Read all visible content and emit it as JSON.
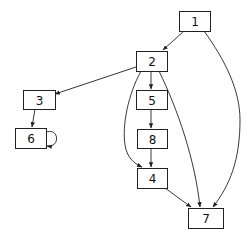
{
  "diagram": {
    "type": "directed-graph",
    "nodes": [
      {
        "id": "1",
        "label": "1",
        "x": 179,
        "y": 11,
        "w": 31,
        "h": 20
      },
      {
        "id": "2",
        "label": "2",
        "x": 136,
        "y": 51,
        "w": 31,
        "h": 20
      },
      {
        "id": "3",
        "label": "3",
        "x": 23,
        "y": 90,
        "w": 32,
        "h": 19
      },
      {
        "id": "5",
        "label": "5",
        "x": 136,
        "y": 90,
        "w": 31,
        "h": 19
      },
      {
        "id": "6",
        "label": "6",
        "x": 15,
        "y": 128,
        "w": 31,
        "h": 20
      },
      {
        "id": "8",
        "label": "8",
        "x": 137,
        "y": 129,
        "w": 30,
        "h": 19
      },
      {
        "id": "4",
        "label": "4",
        "x": 137,
        "y": 168,
        "w": 30,
        "h": 20
      },
      {
        "id": "7",
        "label": "7",
        "x": 188,
        "y": 208,
        "w": 35,
        "h": 20
      }
    ],
    "edges": [
      {
        "from": "1",
        "to": "2"
      },
      {
        "from": "1",
        "to": "7"
      },
      {
        "from": "2",
        "to": "3"
      },
      {
        "from": "2",
        "to": "5"
      },
      {
        "from": "2",
        "to": "4"
      },
      {
        "from": "2",
        "to": "7"
      },
      {
        "from": "3",
        "to": "6"
      },
      {
        "from": "6",
        "to": "6"
      },
      {
        "from": "5",
        "to": "8"
      },
      {
        "from": "8",
        "to": "4"
      },
      {
        "from": "4",
        "to": "7"
      }
    ],
    "colors": {
      "stroke": "#222222",
      "fill": "#ffffff",
      "text": "#111111"
    }
  }
}
